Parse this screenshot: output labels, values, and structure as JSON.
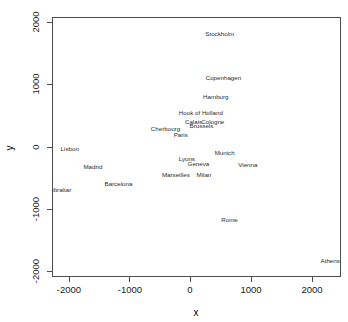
{
  "figure": {
    "title": "",
    "background_color": "#ffffff",
    "frame_color": "#4d4d4d",
    "label_color": "#2b2b2b"
  },
  "axes": {
    "x_title": "x",
    "y_title": "y",
    "x_ticks": [
      "-2000",
      "-1000",
      "0",
      "1000",
      "2000"
    ],
    "y_ticks": [
      "2000",
      "1000",
      "0",
      "-1000",
      "-2000"
    ]
  },
  "chart_data": {
    "type": "scatter",
    "title": "",
    "xlabel": "x",
    "ylabel": "y",
    "xlim": [
      -2450,
      2500
    ],
    "ylim": [
      -2100,
      2100
    ],
    "xticks": [
      -2000,
      -1000,
      0,
      1000,
      2000
    ],
    "yticks": [
      -2000,
      -1000,
      0,
      1000,
      2000
    ],
    "grid": false,
    "legend": "none",
    "marker": "text-label-only",
    "points": [
      {
        "label": "Athens",
        "x": 2290,
        "y": -1800
      },
      {
        "label": "Barcelona",
        "x": -1180,
        "y": -580
      },
      {
        "label": "Brussels",
        "x": 180,
        "y": 340
      },
      {
        "label": "Calais",
        "x": 50,
        "y": 400
      },
      {
        "label": "Cherbourg",
        "x": -410,
        "y": 290
      },
      {
        "label": "Cologne",
        "x": 365,
        "y": 400
      },
      {
        "label": "Copenhagen",
        "x": 540,
        "y": 1100
      },
      {
        "label": "Geneva",
        "x": 130,
        "y": -260
      },
      {
        "label": "Gibraltar",
        "x": -2150,
        "y": -680
      },
      {
        "label": "Hamburg",
        "x": 415,
        "y": 790
      },
      {
        "label": "Hook of Holland",
        "x": 170,
        "y": 540
      },
      {
        "label": "Lisbon",
        "x": -1980,
        "y": -30
      },
      {
        "label": "Lyons",
        "x": -60,
        "y": -190
      },
      {
        "label": "Madrid",
        "x": -1600,
        "y": -320
      },
      {
        "label": "Marseilles",
        "x": -240,
        "y": -450
      },
      {
        "label": "Milan",
        "x": 220,
        "y": -450
      },
      {
        "label": "Munich",
        "x": 560,
        "y": -100
      },
      {
        "label": "Paris",
        "x": -160,
        "y": 190
      },
      {
        "label": "Rome",
        "x": 640,
        "y": -1150
      },
      {
        "label": "Stockholm",
        "x": 480,
        "y": 1800
      },
      {
        "label": "Vienna",
        "x": 940,
        "y": -290
      }
    ]
  },
  "labels": {
    "athens": "Athens",
    "barcelona": "Barcelona",
    "brussels": "Brussels",
    "calais": "Calais",
    "cherbourg": "Cherbourg",
    "cologne": "Cologne",
    "copenhagen": "Copenhagen",
    "geneva": "Geneva",
    "gibraltar": "Gibraltar",
    "hamburg": "Hamburg",
    "hook_of_holland": "Hook of Holland",
    "lisbon": "Lisbon",
    "lyons": "Lyons",
    "madrid": "Madrid",
    "marseilles": "Marseilles",
    "milan": "Milan",
    "munich": "Munich",
    "paris": "Paris",
    "rome": "Rome",
    "stockholm": "Stockholm",
    "vienna": "Vienna"
  }
}
